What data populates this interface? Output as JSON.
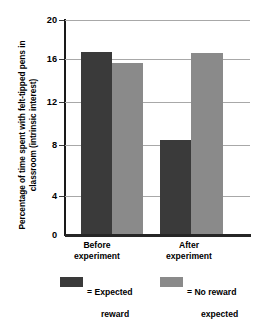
{
  "chart_data": {
    "type": "bar",
    "title": "",
    "subtitle": "",
    "xlabel": "",
    "ylabel": "Percentage of time spent with felt-tipped pens in classroom (intrinsic interest)",
    "categories": [
      "Before\nexperiment",
      "After\nexperiment"
    ],
    "series": [
      {
        "name": "= Expected\nreward",
        "values": [
          17.0,
          8.9
        ],
        "color": "#3a3a3a"
      },
      {
        "name": "= No reward\nexpected",
        "values": [
          16.0,
          16.9
        ],
        "color": "#8a8a8a"
      }
    ],
    "ylim": [
      0,
      20
    ],
    "yticks": [
      0,
      4,
      8,
      12,
      16,
      20
    ],
    "ytick_labels": [
      "0",
      "4",
      "8",
      "12",
      "16",
      "20"
    ],
    "grid": true,
    "grid_axis": "y",
    "legend_position": "bottom"
  },
  "axis": {
    "y_title": "Percentage of time spent with felt-tipped pens in classroom (intrinsic interest)"
  },
  "categories": [
    {
      "line1": "Before",
      "line2": "experiment"
    },
    {
      "line1": "After",
      "line2": "experiment"
    }
  ],
  "legend": [
    {
      "label_line1": "= Expected",
      "label_line2": "reward",
      "color": "#3a3a3a"
    },
    {
      "label_line1": "= No reward",
      "label_line2": "expected",
      "color": "#8a8a8a"
    }
  ],
  "colors": {
    "dark_series": "#3a3a3a",
    "light_series": "#8a8a8a",
    "gridline": "#a8a8a8",
    "axis": "#1a1a1a",
    "background": "#ffffff"
  }
}
